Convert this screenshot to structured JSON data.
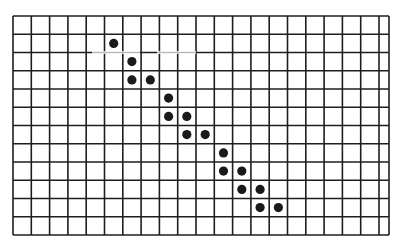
{
  "figure": {
    "type": "grid-with-dots",
    "background": "#ffffff",
    "line_color": "#1e1e1e",
    "dot_color": "#1a1a1a",
    "grid": {
      "columns": 21,
      "rows": 12,
      "origin_x": 13,
      "origin_y": 16,
      "right_x": 389,
      "bottom_y": 235,
      "cell_width": 18.3,
      "cell_height": 18.25
    },
    "dots": [
      {
        "col": 5,
        "row": 1
      },
      {
        "col": 6,
        "row": 2
      },
      {
        "col": 6,
        "row": 3
      },
      {
        "col": 7,
        "row": 3
      },
      {
        "col": 8,
        "row": 4
      },
      {
        "col": 8,
        "row": 5
      },
      {
        "col": 9,
        "row": 5
      },
      {
        "col": 9,
        "row": 6
      },
      {
        "col": 10,
        "row": 6
      },
      {
        "col": 11,
        "row": 7
      },
      {
        "col": 11,
        "row": 8
      },
      {
        "col": 12,
        "row": 8
      },
      {
        "col": 12,
        "row": 9
      },
      {
        "col": 13,
        "row": 9
      },
      {
        "col": 13,
        "row": 10
      },
      {
        "col": 14,
        "row": 10
      }
    ],
    "faded_segments": [
      {
        "row_line": 2,
        "x1": 92,
        "x2": 140
      },
      {
        "row_line": 2,
        "x1": 157,
        "x2": 196
      }
    ]
  }
}
